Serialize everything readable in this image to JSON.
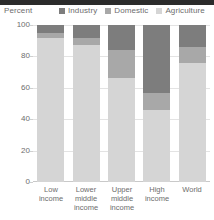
{
  "axis_unit_label": "Percent",
  "legend": {
    "items": [
      {
        "label": "Industry",
        "color": "#7d7d7d",
        "icon": "legend-swatch-icon"
      },
      {
        "label": "Domestic",
        "color": "#a8a8a8",
        "icon": "legend-swatch-icon"
      },
      {
        "label": "Agriculture",
        "color": "#d5d5d5",
        "icon": "legend-swatch-icon"
      }
    ]
  },
  "yticks": [
    "100",
    "80",
    "60",
    "40",
    "20",
    "0"
  ],
  "xlabels": [
    "Low\nincome",
    "Lower\nmiddle\nincome",
    "Upper\nmiddle\nincome",
    "High\nincome",
    "World"
  ],
  "chart_data": {
    "type": "bar",
    "subtype": "stacked-column",
    "title": "",
    "xlabel": "",
    "ylabel": "Percent",
    "ylim": [
      0,
      100
    ],
    "yticks": [
      0,
      20,
      40,
      60,
      80,
      100
    ],
    "grid": true,
    "legend_position": "top-right",
    "categories": [
      "Low income",
      "Lower middle income",
      "Upper middle income",
      "High income",
      "World"
    ],
    "series": [
      {
        "name": "Industry",
        "color": "#7d7d7d",
        "values": [
          5,
          8,
          16,
          43,
          14
        ]
      },
      {
        "name": "Domestic",
        "color": "#a8a8a8",
        "values": [
          3,
          5,
          18,
          11,
          10
        ]
      },
      {
        "name": "Agriculture",
        "color": "#d5d5d5",
        "values": [
          92,
          87,
          66,
          46,
          76
        ]
      }
    ],
    "stack_totals": [
      100,
      100,
      100,
      100,
      100
    ]
  }
}
